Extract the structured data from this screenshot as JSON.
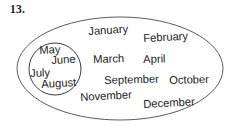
{
  "figure": {
    "problem_number": "13.",
    "background_color": "#fefefe",
    "stroke_color": "#4a4a4a",
    "text_color": "#242424"
  },
  "outer_set": {
    "name": "months-of-the-year",
    "shape": "ellipse",
    "cx": 120,
    "cy": 68.5,
    "rx": 103,
    "ry": 51.5
  },
  "inner_set": {
    "name": "summer-months",
    "shape": "ellipse",
    "cx": 55,
    "cy": 69,
    "rx": 26,
    "ry": 26
  },
  "months": [
    {
      "label": "January",
      "x": 88,
      "y": 26,
      "size": 11.2,
      "rotate": -3.5,
      "region": "outer"
    },
    {
      "label": "February",
      "x": 143,
      "y": 33,
      "size": 11.2,
      "rotate": -3.0,
      "region": "outer"
    },
    {
      "label": "March",
      "x": 93,
      "y": 54,
      "size": 11.2,
      "rotate": -1.5,
      "region": "outer"
    },
    {
      "label": "April",
      "x": 143,
      "y": 54,
      "size": 11.2,
      "rotate": -1.5,
      "region": "outer"
    },
    {
      "label": "September",
      "x": 104,
      "y": 75,
      "size": 11.2,
      "rotate": -1.5,
      "region": "outer"
    },
    {
      "label": "October",
      "x": 169,
      "y": 75,
      "size": 11.2,
      "rotate": -1.5,
      "region": "outer"
    },
    {
      "label": "November",
      "x": 80,
      "y": 92,
      "size": 11.2,
      "rotate": -3.0,
      "region": "outer"
    },
    {
      "label": "December",
      "x": 143,
      "y": 99,
      "size": 11.2,
      "rotate": -3.0,
      "region": "outer"
    },
    {
      "label": "May",
      "x": 39,
      "y": 45,
      "size": 11.2,
      "rotate": -2.5,
      "region": "inner"
    },
    {
      "label": "June",
      "x": 51,
      "y": 55,
      "size": 11.2,
      "rotate": -3.0,
      "region": "inner"
    },
    {
      "label": "July",
      "x": 30,
      "y": 68,
      "size": 11.2,
      "rotate": -2.0,
      "region": "inner"
    },
    {
      "label": "August",
      "x": 41,
      "y": 79,
      "size": 11.2,
      "rotate": -3.5,
      "region": "inner"
    }
  ]
}
